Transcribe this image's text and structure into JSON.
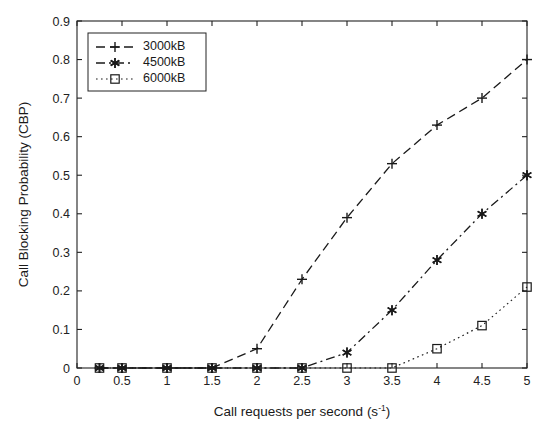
{
  "chart_data": {
    "type": "line",
    "title": "",
    "xlabel": "Call requests per second (s-1)",
    "xlabel_base": "Call requests per second (s",
    "xlabel_sup": "-1",
    "xlabel_tail": ")",
    "ylabel": "Call Blocking Probability (CBP)",
    "xlim": [
      0,
      5
    ],
    "ylim": [
      0,
      0.9
    ],
    "xticks": [
      0,
      0.5,
      1,
      1.5,
      2,
      2.5,
      3,
      3.5,
      4,
      4.5,
      5
    ],
    "xticklabels": [
      "0",
      "0.5",
      "1",
      "1.5",
      "2",
      "2.5",
      "3",
      "3.5",
      "4",
      "4.5",
      "5"
    ],
    "yticks": [
      0,
      0.1,
      0.2,
      0.3,
      0.4,
      0.5,
      0.6,
      0.7,
      0.8,
      0.9
    ],
    "yticklabels": [
      "0",
      "0.1",
      "0.2",
      "0.3",
      "0.4",
      "0.5",
      "0.6",
      "0.7",
      "0.8",
      "0.9"
    ],
    "grid": false,
    "legend_position": "upper left",
    "x": [
      0.25,
      0.5,
      1,
      1.5,
      2,
      2.5,
      3,
      3.5,
      4,
      4.5,
      5
    ],
    "series": [
      {
        "name": "3000kB",
        "marker": "plus",
        "linestyle": "dashed",
        "color": "#1a1a1a",
        "values": [
          0,
          0,
          0,
          0,
          0.05,
          0.23,
          0.39,
          0.53,
          0.63,
          0.7,
          0.8
        ]
      },
      {
        "name": "4500kB",
        "marker": "star",
        "linestyle": "dashdot",
        "color": "#1a1a1a",
        "values": [
          0,
          0,
          0,
          0,
          0,
          0,
          0.04,
          0.15,
          0.28,
          0.4,
          0.5
        ]
      },
      {
        "name": "6000kB",
        "marker": "square",
        "linestyle": "dotted",
        "color": "#1a1a1a",
        "values": [
          0,
          0,
          0,
          0,
          0,
          0,
          0,
          0,
          0.05,
          0.11,
          0.21
        ]
      }
    ]
  },
  "legend": {
    "entries": [
      {
        "label": "3000kB"
      },
      {
        "label": "4500kB"
      },
      {
        "label": "6000kB"
      }
    ]
  }
}
